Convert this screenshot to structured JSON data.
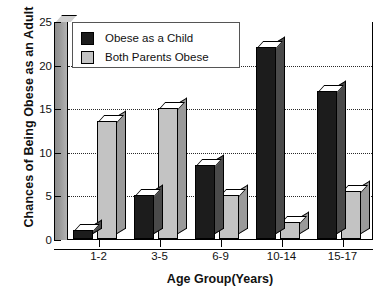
{
  "chart_data": {
    "type": "bar",
    "title": "",
    "xlabel": "Age Group(Years)",
    "ylabel": "Chances of Being Obese as an Adult",
    "categories": [
      "1-2",
      "3-5",
      "6-9",
      "10-14",
      "15-17"
    ],
    "series": [
      {
        "name": "Obese as a Child",
        "color": "#1c1c1c",
        "values": [
          1,
          5,
          8.5,
          22,
          17
        ]
      },
      {
        "name": "Both Parents Obese",
        "color": "#c3c3c3",
        "values": [
          13.5,
          15,
          5,
          2,
          5.5
        ]
      }
    ],
    "ylim": [
      0,
      25
    ],
    "yticks": [
      0,
      5,
      10,
      15,
      20,
      25
    ],
    "grid": "horizontal-dotted",
    "legend_position": "top-left",
    "style": "3d-bars"
  }
}
